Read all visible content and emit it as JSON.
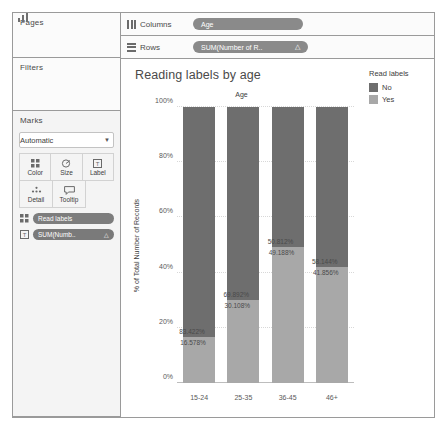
{
  "shelves": {
    "pages_label": "Pages",
    "filters_label": "Filters",
    "marks_label": "Marks",
    "columns_label": "Columns",
    "rows_label": "Rows",
    "columns_pill": "Age",
    "rows_pill": "SUM(Number of R..",
    "rows_pill_delta": "△"
  },
  "marks": {
    "type_label": "Automatic",
    "buttons": [
      {
        "name": "color",
        "label": "Color",
        "icon": "color-icon"
      },
      {
        "name": "size",
        "label": "Size",
        "icon": "size-icon"
      },
      {
        "name": "label",
        "label": "Label",
        "icon": "label-icon"
      },
      {
        "name": "detail",
        "label": "Detail",
        "icon": "detail-icon"
      },
      {
        "name": "tooltip",
        "label": "Tooltip",
        "icon": "tooltip-icon"
      }
    ],
    "pills": [
      {
        "name": "read-labels",
        "label": "Read labels",
        "icon": "color-icon",
        "delta": ""
      },
      {
        "name": "sum-number",
        "label": "SUM(Numb..",
        "icon": "label-icon",
        "delta": "△"
      }
    ]
  },
  "legend": {
    "title": "Read labels",
    "items": [
      {
        "label": "No",
        "color": "#6e6e6e"
      },
      {
        "label": "Yes",
        "color": "#a8a8a8"
      }
    ]
  },
  "chart_data": {
    "type": "bar",
    "title": "Reading labels by age",
    "xlabel": "Age",
    "ylabel": "% of Total Number of Records",
    "ylim": [
      0,
      100
    ],
    "yticks": [
      "0%",
      "20%",
      "40%",
      "60%",
      "80%",
      "100%"
    ],
    "ytick_values": [
      0,
      20,
      40,
      60,
      80,
      100
    ],
    "grid": true,
    "stacked": true,
    "legend_position": "right",
    "categories": [
      "15-24",
      "25-35",
      "36-45",
      "46+"
    ],
    "series": [
      {
        "name": "No",
        "color": "#6e6e6e",
        "values": [
          83.422,
          69.892,
          50.812,
          58.144
        ],
        "labels": [
          "83.422%",
          "69.892%",
          "50.812%",
          "58.144%"
        ]
      },
      {
        "name": "Yes",
        "color": "#a8a8a8",
        "values": [
          16.578,
          30.108,
          49.188,
          41.856
        ],
        "labels": [
          "16.578%",
          "30.108%",
          "49.188%",
          "41.856%"
        ]
      }
    ]
  }
}
